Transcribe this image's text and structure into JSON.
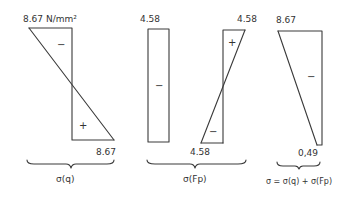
{
  "diagram": {
    "colors": {
      "ink": "#3a3a3a",
      "background": "#ffffff"
    },
    "panels": [
      {
        "id": "sigma-q",
        "top_label": "8.67 N/mm²",
        "bottom_label": "8.67",
        "signs": {
          "upper": "−",
          "lower": "+"
        },
        "caption": "σ(q)"
      },
      {
        "id": "sigma-fp",
        "left_block": {
          "top_label": "4.58",
          "sign": "−"
        },
        "right_block": {
          "top_label": "4.58",
          "bottom_label": "4.58",
          "signs": {
            "upper": "+",
            "lower": "−"
          }
        },
        "caption": "σ(Fp)"
      },
      {
        "id": "sigma-total",
        "top_label": "8.67",
        "bottom_label": "0,49",
        "sign": "−",
        "caption": "σ = σ(q) + σ(Fp)"
      }
    ]
  }
}
